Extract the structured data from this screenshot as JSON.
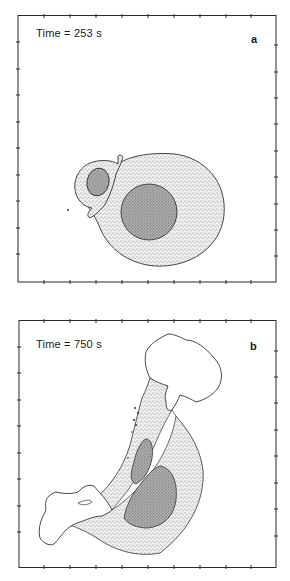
{
  "figure": {
    "panels": [
      {
        "id": "a",
        "time_label": "Time = 253 s",
        "letter": "a"
      },
      {
        "id": "b",
        "time_label": "Time = 750 s",
        "letter": "b"
      }
    ],
    "colors": {
      "frame": "#2a2a2a",
      "outline": "#333333",
      "light_stipple": "#d6d6d6",
      "dark_stipple": "#9a9a9a"
    }
  }
}
